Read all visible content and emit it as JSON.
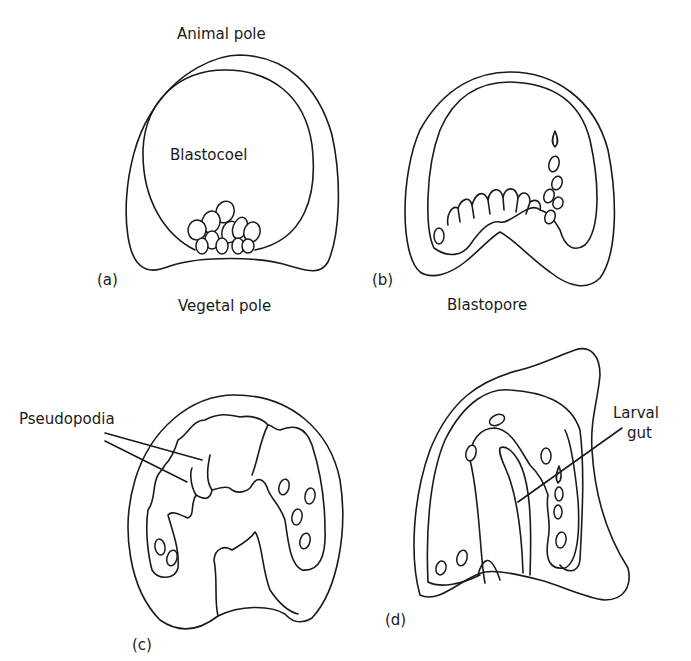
{
  "figure": {
    "panels": [
      {
        "id": "a",
        "label": "(a)",
        "labels": {
          "top": "Animal pole",
          "center": "Blastocoel",
          "bottom": "Vegetal pole"
        }
      },
      {
        "id": "b",
        "label": "(b)",
        "labels": {
          "bottom": "Blastopore"
        }
      },
      {
        "id": "c",
        "label": "(c)",
        "labels": {
          "callout": "Pseudopodia"
        }
      },
      {
        "id": "d",
        "label": "(d)",
        "labels": {
          "callout_line1": "Larval",
          "callout_line2": "gut"
        }
      }
    ],
    "colors": {
      "line": "#1a1a1a",
      "background": "#ffffff"
    }
  }
}
